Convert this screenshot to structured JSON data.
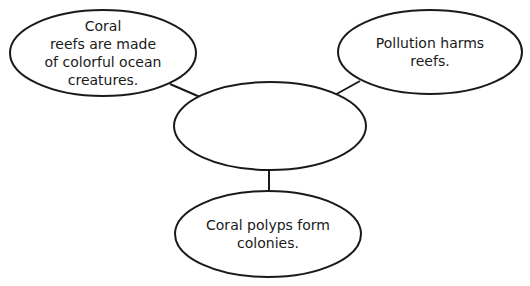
{
  "diagram": {
    "type": "concept-web",
    "stroke_color": "#1a1a1a",
    "center": {
      "label": ""
    },
    "nodes": [
      {
        "id": "top-left",
        "label": "Coral\nreefs are made\nof colorful ocean\ncreatures."
      },
      {
        "id": "top-right",
        "label": "Pollution harms\nreefs."
      },
      {
        "id": "bottom",
        "label": "Coral polyps form\ncolonies."
      }
    ]
  }
}
